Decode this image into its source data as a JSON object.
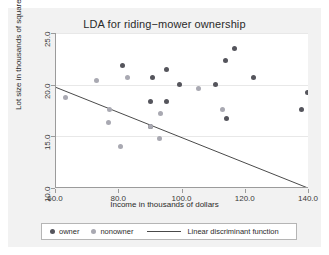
{
  "chart_data": {
    "type": "scatter",
    "title": "LDA for riding−mower ownership",
    "xlabel": "Income in thousands of dollars",
    "ylabel": "Lot size in thousands of square feet",
    "xlim": [
      60.0,
      140.0
    ],
    "ylim": [
      10.0,
      25.0
    ],
    "xticks": [
      "60.0",
      "80.0",
      "100.0",
      "120.0",
      "140.0"
    ],
    "xtick_values": [
      60.0,
      80.0,
      100.0,
      120.0,
      140.0
    ],
    "yticks": [
      "10.0",
      "15.0",
      "20.0",
      "25.0"
    ],
    "ytick_values": [
      10.0,
      15.0,
      20.0,
      25.0
    ],
    "grid": "horizontal",
    "legend_position": "bottom",
    "series": [
      {
        "name": "owner",
        "marker": "circle",
        "color": "#55555c",
        "points": [
          [
            81.0,
            21.9
          ],
          [
            90.5,
            20.7
          ],
          [
            94.8,
            21.5
          ],
          [
            116.5,
            23.5
          ],
          [
            113.5,
            22.3
          ],
          [
            122.5,
            20.7
          ],
          [
            99.0,
            20.0
          ],
          [
            110.5,
            20.0
          ],
          [
            89.8,
            18.4
          ],
          [
            95.0,
            18.4
          ],
          [
            114.0,
            16.7
          ],
          [
            137.5,
            17.6
          ],
          [
            139.5,
            19.2
          ],
          [
            90.0,
            16.0
          ]
        ]
      },
      {
        "name": "nonowner",
        "marker": "diamond",
        "color": "#a9a9b2",
        "points": [
          [
            63.0,
            18.8
          ],
          [
            72.8,
            20.4
          ],
          [
            82.5,
            20.7
          ],
          [
            105.0,
            19.6
          ],
          [
            77.0,
            17.6
          ],
          [
            93.0,
            17.2
          ],
          [
            112.8,
            17.6
          ],
          [
            76.5,
            16.3
          ],
          [
            89.8,
            16.0
          ],
          [
            92.8,
            14.8
          ],
          [
            80.5,
            14.0
          ]
        ]
      }
    ],
    "line": {
      "name": "Linear discriminant function",
      "color": "#4a4a4a",
      "x0": 60.0,
      "y0": 19.7,
      "x1": 140.0,
      "y1": 9.9
    }
  },
  "legend": {
    "owner_label": "owner",
    "nonowner_label": "nonowner",
    "line_label": "Linear discriminant function"
  }
}
